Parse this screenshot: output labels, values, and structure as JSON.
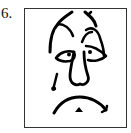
{
  "item": {
    "number_label": "6."
  },
  "figure": {
    "expression": "sad",
    "features": [
      "eyebrows",
      "drooping-eyes",
      "large-nose",
      "teardrop",
      "frowning-mouth"
    ],
    "colors": {
      "ink": "#000000",
      "frame": "#333333",
      "background": "#ffffff"
    }
  }
}
